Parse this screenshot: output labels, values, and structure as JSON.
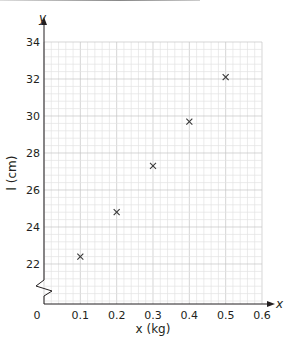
{
  "chart_data": {
    "type": "scatter",
    "title": "",
    "xlabel": "x (kg)",
    "ylabel": "l (cm)",
    "x_axis_letter": "x",
    "y_axis_letter": "y",
    "xlim": [
      0,
      0.6
    ],
    "ylim": [
      22,
      34
    ],
    "y_axis_break": true,
    "grid": true,
    "marker": "x",
    "x_ticks": [
      "0",
      "0.1",
      "0.2",
      "0.3",
      "0.4",
      "0.5",
      "0.6"
    ],
    "y_ticks": [
      "22",
      "24",
      "26",
      "28",
      "30",
      "32",
      "34"
    ],
    "series": [
      {
        "name": "data",
        "x": [
          0.1,
          0.2,
          0.3,
          0.4,
          0.5
        ],
        "y": [
          22.4,
          24.8,
          27.3,
          29.7,
          32.1
        ]
      }
    ]
  },
  "colors": {
    "grid_minor": "#e2e2e2",
    "grid_major": "#c4c4c4",
    "axis": "#231f20",
    "marker": "#3a3a3a"
  }
}
